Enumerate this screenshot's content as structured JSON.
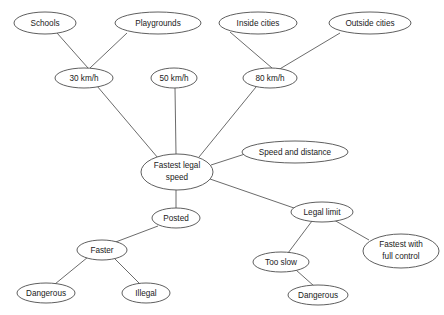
{
  "diagram": {
    "type": "concept-map",
    "canvas": {
      "width": 444,
      "height": 315
    },
    "style": {
      "background": "#ffffff",
      "node_fill": "#ffffff",
      "node_stroke": "#4d4d4d",
      "edge_stroke": "#5a5a5a",
      "text_color": "#1a1a1a"
    },
    "nodes": [
      {
        "id": "schools",
        "label": "Schools",
        "cx": 45,
        "cy": 23,
        "rx": 31,
        "ry": 11
      },
      {
        "id": "playgrounds",
        "label": "Playgrounds",
        "cx": 158,
        "cy": 23,
        "rx": 43,
        "ry": 11
      },
      {
        "id": "inside",
        "label": "Inside cities",
        "cx": 258,
        "cy": 23,
        "rx": 39,
        "ry": 11
      },
      {
        "id": "outside",
        "label": "Outside cities",
        "cx": 370,
        "cy": 23,
        "rx": 41,
        "ry": 11
      },
      {
        "id": "kmh30",
        "label": "30 km/h",
        "cx": 84,
        "cy": 78,
        "rx": 29,
        "ry": 10
      },
      {
        "id": "kmh50",
        "label": "50 km/h",
        "cx": 174,
        "cy": 78,
        "rx": 23,
        "ry": 10
      },
      {
        "id": "kmh80",
        "label": "80 km/h",
        "cx": 270,
        "cy": 78,
        "rx": 27,
        "ry": 10
      },
      {
        "id": "fastestlegal",
        "label": "Fastest legal\nspeed",
        "line1": "Fastest legal",
        "line2": "speed",
        "cx": 177,
        "cy": 172,
        "rx": 36,
        "ry": 18
      },
      {
        "id": "speeddistance",
        "label": "Speed and distance",
        "cx": 295,
        "cy": 152,
        "rx": 53,
        "ry": 11
      },
      {
        "id": "posted",
        "label": "Posted",
        "cx": 176,
        "cy": 218,
        "rx": 24,
        "ry": 10
      },
      {
        "id": "faster",
        "label": "Faster",
        "cx": 102,
        "cy": 250,
        "rx": 25,
        "ry": 10
      },
      {
        "id": "dangerous1",
        "label": "Dangerous",
        "cx": 46,
        "cy": 293,
        "rx": 29,
        "ry": 10
      },
      {
        "id": "illegal",
        "label": "Illegal",
        "cx": 146,
        "cy": 293,
        "rx": 24,
        "ry": 10
      },
      {
        "id": "legallimit",
        "label": "Legal limit",
        "cx": 322,
        "cy": 212,
        "rx": 31,
        "ry": 10
      },
      {
        "id": "fastestfull",
        "label": "Fastest with\nfull control",
        "line1": "Fastest with",
        "line2": "full control",
        "cx": 401,
        "cy": 251,
        "rx": 38,
        "ry": 17
      },
      {
        "id": "tooslow",
        "label": "Too slow",
        "cx": 281,
        "cy": 262,
        "rx": 28,
        "ry": 10
      },
      {
        "id": "dangerous2",
        "label": "Dangerous",
        "cx": 318,
        "cy": 295,
        "rx": 30,
        "ry": 10
      }
    ],
    "edges": [
      {
        "from": "schools",
        "to": "kmh30",
        "x1": 57,
        "y1": 33,
        "x2": 88,
        "y2": 68
      },
      {
        "from": "playgrounds",
        "to": "kmh30",
        "x1": 127,
        "y1": 33,
        "x2": 90,
        "y2": 68
      },
      {
        "from": "inside",
        "to": "kmh80",
        "x1": 230,
        "y1": 32,
        "x2": 272,
        "y2": 68
      },
      {
        "from": "outside",
        "to": "kmh80",
        "x1": 340,
        "y1": 33,
        "x2": 278,
        "y2": 70
      },
      {
        "from": "kmh30",
        "to": "fastestlegal",
        "x1": 97,
        "y1": 86,
        "x2": 158,
        "y2": 158
      },
      {
        "from": "kmh50",
        "to": "fastestlegal",
        "x1": 175,
        "y1": 88,
        "x2": 176,
        "y2": 154
      },
      {
        "from": "kmh80",
        "to": "fastestlegal",
        "x1": 256,
        "y1": 87,
        "x2": 199,
        "y2": 157
      },
      {
        "from": "fastestlegal",
        "to": "speeddistance",
        "x1": 211,
        "y1": 165,
        "x2": 245,
        "y2": 154
      },
      {
        "from": "fastestlegal",
        "to": "legallimit",
        "x1": 210,
        "y1": 179,
        "x2": 294,
        "y2": 208
      },
      {
        "from": "fastestlegal",
        "to": "posted",
        "x1": 176,
        "y1": 190,
        "x2": 176,
        "y2": 208
      },
      {
        "from": "posted",
        "to": "faster",
        "x1": 158,
        "y1": 226,
        "x2": 113,
        "y2": 243
      },
      {
        "from": "faster",
        "to": "dangerous1",
        "x1": 88,
        "y1": 257,
        "x2": 55,
        "y2": 284
      },
      {
        "from": "faster",
        "to": "illegal",
        "x1": 114,
        "y1": 258,
        "x2": 140,
        "y2": 284
      },
      {
        "from": "legallimit",
        "to": "tooslow",
        "x1": 312,
        "y1": 221,
        "x2": 288,
        "y2": 253
      },
      {
        "from": "legallimit",
        "to": "fastestfull",
        "x1": 334,
        "y1": 220,
        "x2": 369,
        "y2": 240
      },
      {
        "from": "tooslow",
        "to": "dangerous2",
        "x1": 296,
        "y1": 270,
        "x2": 314,
        "y2": 286
      }
    ]
  }
}
